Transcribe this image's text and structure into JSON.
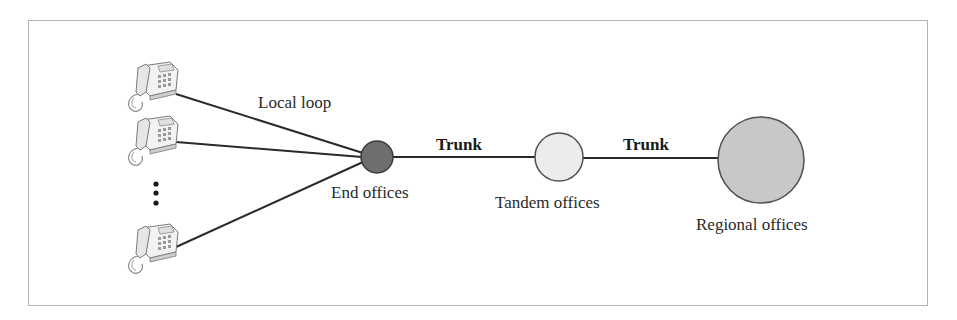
{
  "diagram": {
    "labels": {
      "local_loop": "Local loop",
      "trunk_1": "Trunk",
      "trunk_2": "Trunk",
      "end_offices": "End offices",
      "tandem_offices": "Tandem offices",
      "regional_offices": "Regional offices"
    },
    "icons": {
      "telephone": "telephone-icon",
      "ellipsis": "vertical-ellipsis"
    },
    "nodes": [
      {
        "id": "end-office",
        "label": "End offices",
        "fill": "#6e6e6e"
      },
      {
        "id": "tandem-office",
        "label": "Tandem offices",
        "fill": "#ececec"
      },
      {
        "id": "regional-office",
        "label": "Regional offices",
        "fill": "#c8c8c8"
      }
    ],
    "colors": {
      "line": "#2a2a2a",
      "border": "#b4b4b4",
      "end_fill": "#6e6e6e",
      "tandem_fill": "#ececec",
      "regional_fill": "#c8c8c8"
    }
  }
}
